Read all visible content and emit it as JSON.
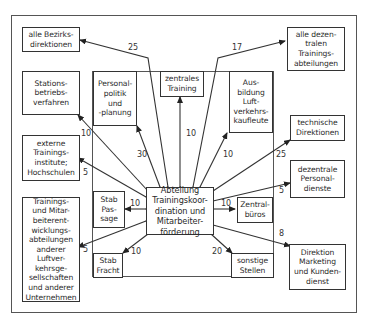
{
  "center": {
    "label": "Abteilung\nTrainingskoor-\ndination und\nMitarbeiter-\nförderung"
  },
  "nodes": [
    {
      "id": "bezirksdirektionen",
      "label": "alle Bezirks-\ndirektionen"
    },
    {
      "id": "dezentrale-training",
      "label": "alle dezen-\ntralen\nTrainings-\nabteilungen"
    },
    {
      "id": "stationsbetrieb",
      "label": "Stations-\nbetriebs-\nverfahren"
    },
    {
      "id": "personalpolitik",
      "label": "Personal-\npolitik\nund\n-planung"
    },
    {
      "id": "zentrales-training",
      "label": "zentrales\nTraining"
    },
    {
      "id": "ausbildung",
      "label": "Aus-\nbildung\nLuft-\nverkehrs-\nkaufleute"
    },
    {
      "id": "technische-direktionen",
      "label": "technische\nDirektionen"
    },
    {
      "id": "externe-institute",
      "label": "externe\nTrainings-\ninstitute;\nHochschulen"
    },
    {
      "id": "dezentrale-personal",
      "label": "dezentrale\nPersonal-\ndienste"
    },
    {
      "id": "stab-passage",
      "label": "Stab\nPas-\nsage"
    },
    {
      "id": "zentralbueros",
      "label": "Zentral-\nbüros"
    },
    {
      "id": "andere-luftverkehr",
      "label": "Trainings-\nund Mitar-\nbeiterent-\nwicklungs-\nabteilungen\nanderer\nLuftver-\nkehrsge-\nsellschaften\nund anderer\nUnternehmen"
    },
    {
      "id": "stab-fracht",
      "label": "Stab\nFracht"
    },
    {
      "id": "sonstige",
      "label": "sonstige\nStellen"
    },
    {
      "id": "direktion-marketing",
      "label": "Direktion\nMarketing\nund Kunden-\ndienst"
    }
  ],
  "edges": [
    {
      "to": "bezirksdirektionen",
      "value": "25"
    },
    {
      "to": "dezentrale-training",
      "value": "17"
    },
    {
      "to": "stationsbetrieb",
      "value": "10"
    },
    {
      "to": "personalpolitik",
      "value": "30"
    },
    {
      "to": "zentrales-training",
      "value": "10"
    },
    {
      "to": "ausbildung",
      "value": "10"
    },
    {
      "to": "technische-direktionen",
      "value": "25"
    },
    {
      "to": "externe-institute",
      "value": "5"
    },
    {
      "to": "dezentrale-personal",
      "value": "5"
    },
    {
      "to": "stab-passage",
      "value": "10"
    },
    {
      "to": "zentralbueros",
      "value": "10"
    },
    {
      "to": "andere-luftverkehr",
      "value": "5"
    },
    {
      "to": "stab-fracht",
      "value": "10"
    },
    {
      "to": "sonstige",
      "value": "20"
    },
    {
      "to": "direktion-marketing",
      "value": "8"
    }
  ]
}
